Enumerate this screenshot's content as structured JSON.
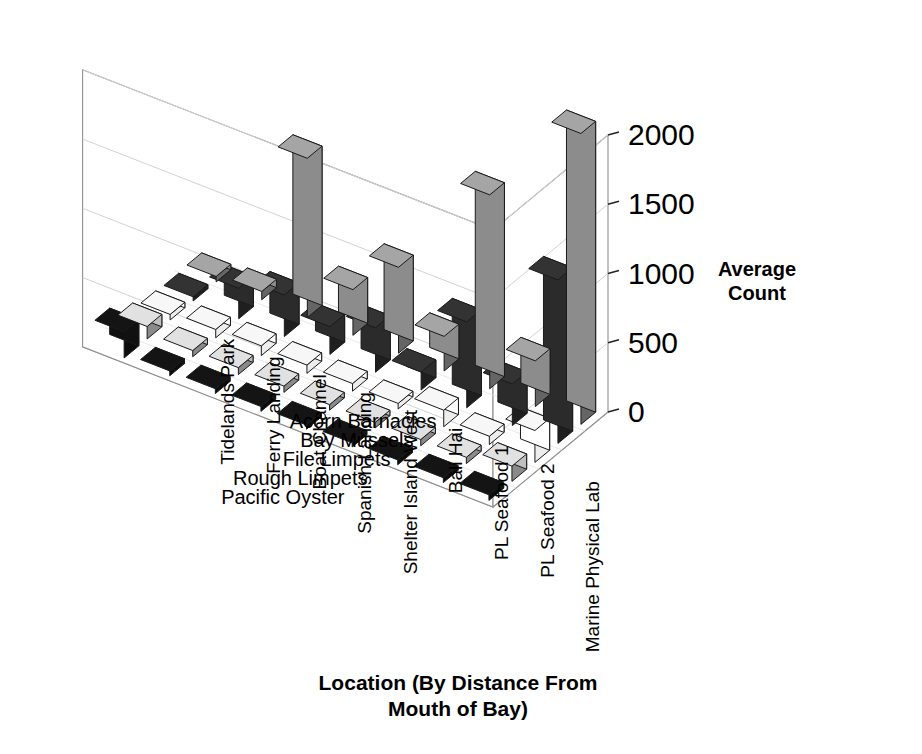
{
  "chart_data": {
    "type": "bar",
    "title": "",
    "subtitle": "",
    "projection": "3d-isometric",
    "xlabel": "Location (By Distance From Mouth of Bay)",
    "xlabel_line1": "Location (By Distance From",
    "xlabel_line2": "Mouth of Bay)",
    "zlabel": "Average Count",
    "zlabel_line1": "Average",
    "zlabel_line2": "Count",
    "ylabel": "",
    "zlim": [
      0,
      2000
    ],
    "ztick_labels": [
      "0",
      "500",
      "1000",
      "1500",
      "2000"
    ],
    "ztick_values": [
      0,
      500,
      1000,
      1500,
      2000
    ],
    "grid": true,
    "legend": "none",
    "categories": [
      "Marine Physical Lab",
      "PL Seafood 2",
      "PL Seafood 1",
      "Bali Hai",
      "Shelter Island West",
      "Spanish Landing",
      "Boat Channel",
      "Ferry Landing",
      "Tidelands Park"
    ],
    "series": [
      {
        "name": "Acorn Barnacles",
        "color": "#8c8c8c",
        "values": [
          2100,
          330,
          1400,
          250,
          620,
          330,
          1150,
          60,
          40
        ]
      },
      {
        "name": "Bay Mussels",
        "color": "#2b2b2b",
        "values": [
          1180,
          300,
          620,
          130,
          320,
          200,
          300,
          220,
          30
        ]
      },
      {
        "name": "File Limpets",
        "color": "#ffffff",
        "values": [
          230,
          60,
          120,
          40,
          55,
          60,
          70,
          60,
          40
        ]
      },
      {
        "name": "Rough Limpets",
        "color": "#bfbfbf",
        "values": [
          110,
          45,
          45,
          40,
          40,
          45,
          50,
          45,
          90
        ]
      },
      {
        "name": "Pacific Oyster",
        "color": "#111111",
        "values": [
          40,
          35,
          35,
          30,
          30,
          35,
          35,
          35,
          190
        ]
      }
    ]
  }
}
